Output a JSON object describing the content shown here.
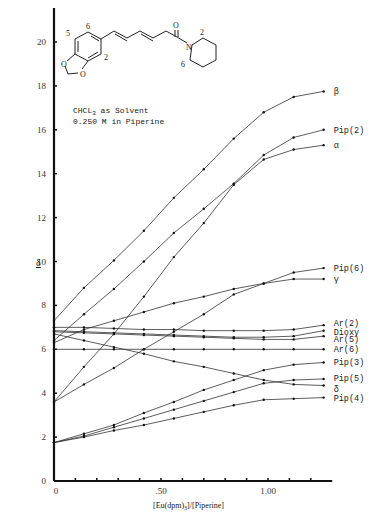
{
  "chart_data": {
    "type": "line",
    "title": "",
    "annotation": [
      "CHCL3 as Solvent",
      "0.250 M in Piperine"
    ],
    "annotation_line1_main": "CHCL",
    "annotation_line1_sub": "3",
    "annotation_line1_rest": " as Solvent",
    "xlabel": "[Eu(dpm)3]/[Piperine]",
    "xlabel_parts": {
      "a": "[Eu(dpm)",
      "sub": "3",
      "b": "]/[Piperine]"
    },
    "ylabel": "δ",
    "xlim": [
      0,
      1.3
    ],
    "ylim": [
      0,
      21.5
    ],
    "x_ticks": [
      0,
      0.1,
      0.2,
      0.3,
      0.4,
      0.5,
      0.6,
      0.7,
      0.8,
      0.9,
      1.0,
      1.1,
      1.2
    ],
    "x_tick_labels": [
      {
        "value": 0,
        "label": "0"
      },
      {
        "value": 0.5,
        "label": ".50"
      },
      {
        "value": 1.0,
        "label": "1.00"
      }
    ],
    "y_ticks": [
      0,
      2,
      4,
      6,
      8,
      10,
      12,
      14,
      16,
      18,
      20
    ],
    "y_tick_labels": [
      "0",
      "2",
      "4",
      "6",
      "8",
      "10",
      "12",
      "14",
      "16",
      "18",
      "20"
    ],
    "grid": false,
    "x": [
      0,
      0.14,
      0.28,
      0.42,
      0.56,
      0.7,
      0.84,
      0.98,
      1.12,
      1.26
    ],
    "series": [
      {
        "name": "β",
        "values": [
          7.3,
          8.8,
          10.05,
          11.4,
          12.9,
          14.2,
          15.6,
          16.8,
          17.5,
          17.75
        ]
      },
      {
        "name": "Pip(2)",
        "values": [
          6.4,
          7.6,
          8.75,
          10.0,
          11.3,
          12.4,
          13.55,
          14.85,
          15.65,
          16.0
        ]
      },
      {
        "name": "α",
        "values": [
          3.6,
          5.2,
          6.7,
          8.4,
          10.2,
          11.75,
          13.5,
          14.65,
          15.1,
          15.3
        ]
      },
      {
        "name": "Pip(6)",
        "values": [
          6.3,
          6.9,
          7.3,
          7.7,
          8.1,
          8.4,
          8.75,
          9.0,
          9.5,
          9.7
        ]
      },
      {
        "name": "γ",
        "values": [
          3.6,
          4.4,
          5.15,
          6.0,
          6.8,
          7.6,
          8.5,
          9.0,
          9.2,
          9.2
        ]
      },
      {
        "name": "Ar(2)",
        "values": [
          7.0,
          7.0,
          6.95,
          6.9,
          6.9,
          6.85,
          6.85,
          6.85,
          6.9,
          7.1
        ]
      },
      {
        "name": "Dioxy",
        "values": [
          6.85,
          6.8,
          6.75,
          6.7,
          6.65,
          6.6,
          6.55,
          6.55,
          6.6,
          6.85
        ]
      },
      {
        "name": "Ar(5)",
        "values": [
          6.8,
          6.75,
          6.7,
          6.65,
          6.6,
          6.55,
          6.5,
          6.45,
          6.45,
          6.6
        ]
      },
      {
        "name": "Ar(6)",
        "values": [
          6.0,
          6.0,
          6.0,
          6.0,
          6.0,
          6.0,
          6.0,
          6.0,
          6.0,
          6.0
        ]
      },
      {
        "name": "Pip(3)",
        "values": [
          1.75,
          2.15,
          2.55,
          3.1,
          3.6,
          4.15,
          4.6,
          5.05,
          5.3,
          5.4
        ]
      },
      {
        "name": "Pip(5)",
        "values": [
          1.75,
          2.05,
          2.45,
          2.85,
          3.25,
          3.65,
          4.05,
          4.45,
          4.6,
          4.65
        ]
      },
      {
        "name": "δ",
        "values": [
          6.7,
          6.4,
          6.1,
          5.8,
          5.45,
          5.2,
          4.9,
          4.6,
          4.4,
          4.35
        ]
      },
      {
        "name": "Pip(4)",
        "values": [
          1.75,
          2.0,
          2.3,
          2.55,
          2.85,
          3.15,
          3.45,
          3.7,
          3.75,
          3.8
        ]
      }
    ],
    "structure_atoms": {
      "ar6": "6",
      "ar5": "5",
      "ar2": "2",
      "o1": "O",
      "o2": "O",
      "carbonyl_o": "O",
      "n": "N",
      "pip2": "2",
      "pip6": "6"
    }
  }
}
